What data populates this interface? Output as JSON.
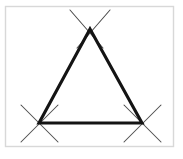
{
  "figure": {
    "canvas": {
      "width": 183,
      "height": 159
    },
    "background_color": "#ffffff",
    "frame": {
      "name": "image-border",
      "x": 5.5,
      "y": 6.5,
      "width": 168,
      "height": 140,
      "stroke_color": "#d8d8d8",
      "stroke_width": 1.4,
      "fill": "#ffffff"
    },
    "triangle": {
      "name": "equilateral-triangle",
      "stroke_color": "#141414",
      "stroke_width": 3.1,
      "fill": "none",
      "vertices": [
        {
          "label": "apex",
          "name": "vertex-top",
          "x": 90,
          "y": 29
        },
        {
          "label": "left-base",
          "name": "vertex-bottom-left",
          "x": 39,
          "y": 123
        },
        {
          "label": "right-base",
          "name": "vertex-bottom-right",
          "x": 142,
          "y": 123
        }
      ],
      "sides": [
        {
          "name": "side-left",
          "from": "apex",
          "to": "left-base"
        },
        {
          "name": "side-right",
          "from": "apex",
          "to": "right-base"
        },
        {
          "name": "side-bottom",
          "from": "left-base",
          "to": "right-base"
        }
      ]
    },
    "construction_marks": [
      {
        "name": "arc-cross-top",
        "center_x": 90,
        "center_y": 30,
        "stroke_color": "#4a4a4a",
        "stroke_width": 1.05,
        "strokes": [
          {
            "x1": 70,
            "y1": 10,
            "x2": 103,
            "y2": 48
          },
          {
            "x1": 110,
            "y1": 10,
            "x2": 77,
            "y2": 48
          }
        ]
      },
      {
        "name": "arc-cross-bottom-left",
        "center_x": 39,
        "center_y": 123,
        "stroke_color": "#4a4a4a",
        "stroke_width": 1.05,
        "strokes": [
          {
            "x1": 21,
            "y1": 105,
            "x2": 58,
            "y2": 142
          },
          {
            "x1": 58,
            "y1": 105,
            "x2": 21,
            "y2": 142
          }
        ]
      },
      {
        "name": "arc-cross-bottom-right",
        "center_x": 142,
        "center_y": 123,
        "stroke_color": "#4a4a4a",
        "stroke_width": 1.05,
        "strokes": [
          {
            "x1": 124,
            "y1": 105,
            "x2": 161,
            "y2": 142
          },
          {
            "x1": 161,
            "y1": 105,
            "x2": 124,
            "y2": 142
          }
        ]
      }
    ],
    "labels": []
  }
}
